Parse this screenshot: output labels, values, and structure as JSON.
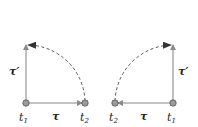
{
  "colors": {
    "line": "#8a8a8a",
    "arc": "#444444",
    "point_fill": "#9a9a9a",
    "point_stroke": "#555555",
    "text": "#222222"
  },
  "panels": [
    {
      "id": "left",
      "labels": {
        "t1": "t",
        "t1_sub": "1",
        "t2": "t",
        "t2_sub": "2",
        "tau": "τ",
        "tau_prime": "τ′"
      },
      "points": {
        "t1": [
          26,
          103
        ],
        "t2": [
          85,
          103
        ],
        "tau_prime_tip": [
          26,
          43
        ]
      },
      "arc": "from t2 dashed quarter-circle to tip of tau_prime"
    },
    {
      "id": "right",
      "labels": {
        "t1": "t",
        "t1_sub": "1",
        "t2": "t",
        "t2_sub": "2",
        "tau": "τ",
        "tau_prime": "τ′"
      },
      "points": {
        "t1": [
          173,
          103
        ],
        "t2": [
          115,
          103
        ],
        "tau_prime_tip": [
          173,
          43
        ]
      },
      "arc": "from t2 dashed quarter-circle to tip of tau_prime"
    }
  ]
}
